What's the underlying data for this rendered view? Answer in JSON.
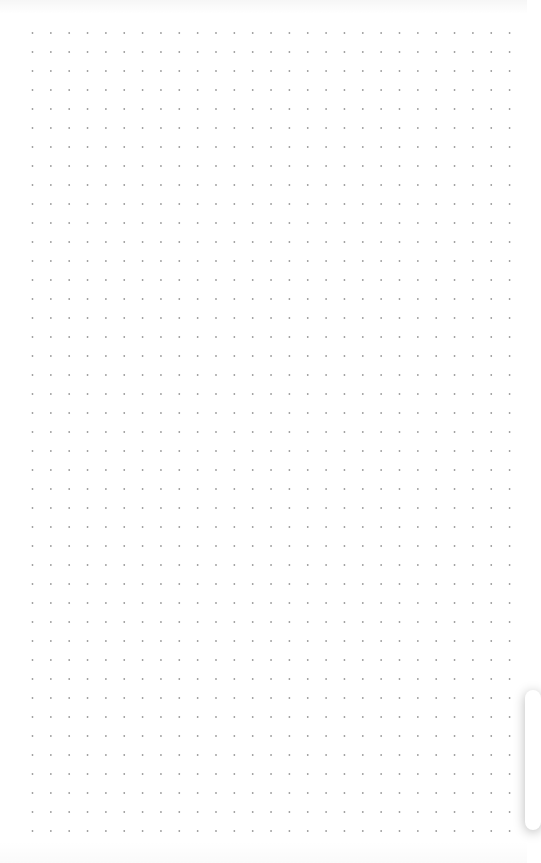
{
  "canvas": {
    "background": "#ffffff",
    "grid": {
      "type": "dots",
      "dot_color": "#9a9a9a",
      "dot_radius": 0.9,
      "origin_x": 32.5,
      "origin_y": 33,
      "spacing_x": 18.35,
      "spacing_y": 19,
      "columns": 27,
      "rows": 43
    }
  },
  "side_toolbar": {
    "state": "mostly off-screen",
    "edge": "right"
  }
}
